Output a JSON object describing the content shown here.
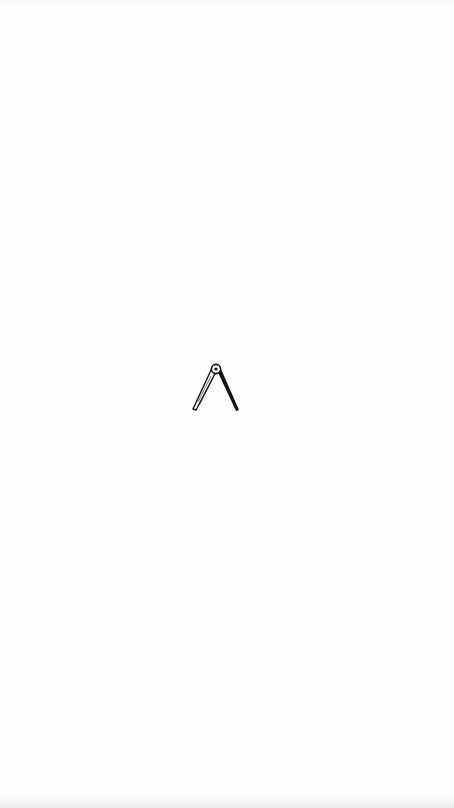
{
  "page": {
    "type": "scanned-book-page",
    "background_color": "#fefefe",
    "ink_color": "#111111",
    "bleed_through_color": "#f2f2f2"
  },
  "printers_device": {
    "icon": "compass-divider-icon",
    "description": "Printer's device: drawing compass / dividers with open legs"
  },
  "bleed_through_lines": [
    {
      "y": 40,
      "text": "· · · · · · · · · · · · · · · · ·"
    },
    {
      "y": 92,
      "text": "· · · · · · · · · · · · · · · · · · · · · · · · · ·"
    },
    {
      "y": 112,
      "text": "· · · · · · · · · · · · · · · · · · · ·"
    },
    {
      "y": 132,
      "text": "· · · · · · · · · · · · · ·"
    },
    {
      "y": 152,
      "text": "· · · · ·"
    },
    {
      "y": 190,
      "text": "· · · · · · · · · · · · · ·"
    },
    {
      "y": 210,
      "text": "· · · · · · · · · · · · ·"
    },
    {
      "y": 250,
      "text": "· · · · · · · · · · ·"
    },
    {
      "y": 270,
      "text": "· · · · · · · · · · · · · · · · · ·"
    },
    {
      "y": 290,
      "text": "· · · · · · · · · · · · · · ·"
    },
    {
      "y": 310,
      "text": "· · · · · · · · · · · ·"
    },
    {
      "y": 330,
      "text": "· · · · · · · · · · · · · · · · ·"
    },
    {
      "y": 410,
      "text": "· · · · · · · · · · · · · · · · · · · ·"
    },
    {
      "y": 430,
      "text": "· · · · · · · · · · · · · · · · · · · · · ·"
    },
    {
      "y": 450,
      "text": "· · · · · · · · · · · · · · · · · · ·"
    },
    {
      "y": 470,
      "text": "· · · · · · · · · · · · · · · · · · · · · · ·"
    },
    {
      "y": 490,
      "text": "· · · · · · · · · · · · · · · ·"
    },
    {
      "y": 510,
      "text": "· · · · · · · · · · · ·"
    },
    {
      "y": 550,
      "text": "· · · · · · · · · · · · · · · · · · · ·"
    },
    {
      "y": 570,
      "text": "· · · · · · · · · · · · · · · · · · · · · ·"
    },
    {
      "y": 610,
      "text": "· · · · · · · · · · · · · · · · · · ·"
    },
    {
      "y": 630,
      "text": "· · · · · · · · · · · · · · · · ·"
    },
    {
      "y": 670,
      "text": "· · · · · · · · · · · · · · · · · · · ·"
    },
    {
      "y": 690,
      "text": "· · · · · · · · · · · · · · · · · ·"
    },
    {
      "y": 740,
      "text": "· · · · · · · · · · · · · · · · · · · · · · · · ·"
    }
  ]
}
